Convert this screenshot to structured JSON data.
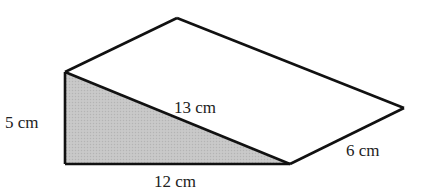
{
  "diagram": {
    "type": "triangular-prism",
    "shaded_face_color": "#c4c4c4",
    "line_color": "#111111",
    "labels": {
      "height": "5 cm",
      "hypotenuse": "13 cm",
      "base": "12 cm",
      "depth": "6 cm"
    }
  }
}
